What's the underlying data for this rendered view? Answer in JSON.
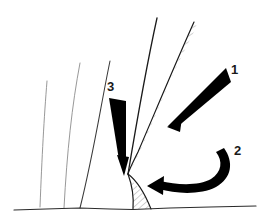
{
  "figure": {
    "background_color": "#ffffff",
    "width": 270,
    "height": 223,
    "labels": [
      {
        "id": "1",
        "text": "1",
        "x": 231,
        "y": 74
      },
      {
        "id": "2",
        "text": "2",
        "x": 234,
        "y": 155
      },
      {
        "id": "3",
        "text": "3",
        "x": 107,
        "y": 91
      }
    ],
    "arrows": [
      {
        "name": "arrow-1",
        "label": "1",
        "style": "straight-tapered-wedge",
        "color": "#000000",
        "tail_x": 227,
        "tail_y": 73,
        "tip_x": 170,
        "tip_y": 126,
        "direction": "down-left"
      },
      {
        "name": "arrow-2",
        "label": "2",
        "style": "curved-tapered-wedge",
        "color": "#000000",
        "tail_x": 228,
        "tail_y": 152,
        "tip_x": 148,
        "tip_y": 190,
        "direction": "left"
      },
      {
        "name": "arrow-3",
        "label": "3",
        "style": "straight-tapered-wedge",
        "color": "#000000",
        "tail_x": 108,
        "tail_y": 102,
        "tip_x": 124,
        "tip_y": 173,
        "direction": "down"
      }
    ],
    "curves": [
      {
        "name": "thin-curve-left-outer",
        "color": "#8c8c8c",
        "stroke_width": 0.9,
        "path": "M 47,81 C 44,118 42,156 40,207"
      },
      {
        "name": "thin-curve-left-inner",
        "color": "#8c8c8c",
        "stroke_width": 0.9,
        "path": "M 80,63 C 72,105 67,152 64,208"
      },
      {
        "name": "dark-curve-mid",
        "color": "#222222",
        "stroke_width": 1.1,
        "path": "M 110,61 C 101,104 94,152 80,208"
      },
      {
        "name": "dark-curve-main",
        "color": "#1a1a1a",
        "stroke_width": 1.3,
        "path": "M 157,18 C 146,68 136,126 128,174"
      },
      {
        "name": "dark-curve-fault-lower",
        "color": "#1a1a1a",
        "stroke_width": 1.2,
        "path": "M 128,174 C 133,186 134,197 133,209"
      },
      {
        "name": "dark-curve-right-limb",
        "color": "#1a1a1a",
        "stroke_width": 1.2,
        "path": "M 194,22 C 176,62 156,110 138,152 C 132,164 129,170 128,174"
      },
      {
        "name": "dark-curve-base-right",
        "color": "#1a1a1a",
        "stroke_width": 1.1,
        "path": "M 128,174 C 135,180 142,188 150,209"
      },
      {
        "name": "baseline",
        "color": "#2b2b2b",
        "stroke_width": 1.2,
        "path": "M 14,210 L 80,208 L 133,209 L 170,208 L 256,206"
      }
    ],
    "hatched_regions": [
      {
        "name": "hatched-band-upper",
        "hatch_color": "#9a9a9a",
        "path": "M 193,24 C 178,62 160,106 142,147 C 136,160 131,169 129,174 C 132,166 137,154 144,140 C 161,100 180,58 197,26 Z"
      },
      {
        "name": "hatched-wedge-base",
        "hatch_color": "#9a9a9a",
        "path": "M 131,180 C 133,190 134,200 133,209 L 152,209 C 146,196 138,186 131,180 Z"
      }
    ]
  }
}
